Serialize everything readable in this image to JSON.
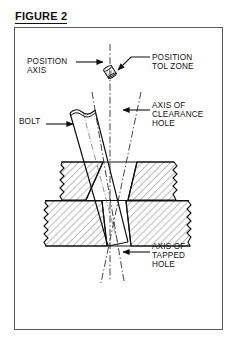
{
  "figure": {
    "title": "FIGURE 2",
    "type": "engineering-cross-section"
  },
  "labels": {
    "position_axis": "POSITION\nAXIS",
    "position_tol_zone": "POSITION\nTOL ZONE",
    "bolt": "BOLT",
    "axis_of_clearance_hole": "AXIS OF\nCLEARANCE\nHOLE",
    "axis_of_tapped_hole": "AXIS OF\nTAPPED\nHOLE"
  },
  "colors": {
    "line": "#111111",
    "frame": "#555b60",
    "background": "#ffffff",
    "hatch": "#3a3a3a",
    "centerline": "#222222"
  },
  "geometry": {
    "frame": {
      "x": 14,
      "y": 27,
      "width": 209,
      "height": 303
    },
    "upper_plate": {
      "x": 58,
      "y": 162,
      "width": 120,
      "height": 38
    },
    "lower_plate": {
      "x": 44,
      "y": 200,
      "width": 148,
      "height": 47
    },
    "tol_zone_center": {
      "x": 110,
      "y": 72
    },
    "position_axis_x": 110
  }
}
